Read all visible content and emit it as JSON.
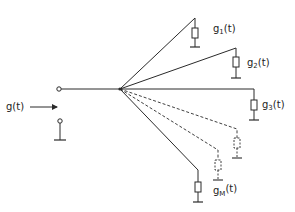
{
  "diagram": {
    "input": {
      "label": "g(t)",
      "label_base": "g",
      "label_arg": "(t)"
    },
    "branches": [
      {
        "id": "1",
        "label_base": "g",
        "label_sub": "1",
        "label_arg": "(t)",
        "style": "solid"
      },
      {
        "id": "2",
        "label_base": "g",
        "label_sub": "2",
        "label_arg": "(t)",
        "style": "solid"
      },
      {
        "id": "3",
        "label_base": "g",
        "label_sub": "3",
        "label_arg": "(t)",
        "style": "solid"
      },
      {
        "id": "dashed-a",
        "label_base": "",
        "label_sub": "",
        "label_arg": "",
        "style": "dashed"
      },
      {
        "id": "dashed-b",
        "label_base": "",
        "label_sub": "",
        "label_arg": "",
        "style": "dashed"
      },
      {
        "id": "M",
        "label_base": "g",
        "label_sub": "M",
        "label_arg": "(t)",
        "style": "solid"
      }
    ],
    "colors": {
      "line": "#2a2a2a",
      "background": "#ffffff"
    }
  }
}
